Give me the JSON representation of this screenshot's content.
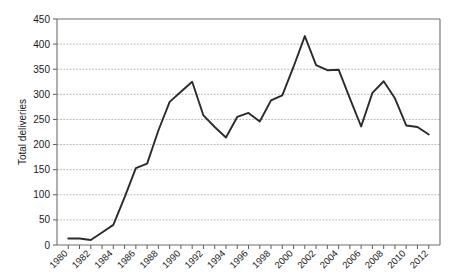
{
  "chart_data": {
    "type": "line",
    "title": "",
    "subtitle": "",
    "xlabel": "",
    "ylabel": "Total deliveries",
    "xlim": [
      1979,
      2013
    ],
    "ylim": [
      0,
      450
    ],
    "ytick_step": 50,
    "xtick_step": 2,
    "grid": true,
    "grid_axis": "y",
    "legend": false,
    "legend_position": "none",
    "yticks": [
      0,
      50,
      100,
      150,
      200,
      250,
      300,
      350,
      400,
      450
    ],
    "ytick_labels": [
      "0",
      "50",
      "100",
      "150",
      "200",
      "250",
      "300",
      "350",
      "400",
      "450"
    ],
    "xticks": [
      1980,
      1982,
      1984,
      1986,
      1988,
      1990,
      1992,
      1994,
      1996,
      1998,
      2000,
      2002,
      2004,
      2006,
      2008,
      2010,
      2012
    ],
    "xtick_labels": [
      "1980",
      "1982",
      "1984",
      "1986",
      "1988",
      "1990",
      "1992",
      "1994",
      "1996",
      "1998",
      "2000",
      "2002",
      "2004",
      "2006",
      "2008",
      "2010",
      "2012"
    ],
    "x": [
      1980,
      1981,
      1982,
      1983,
      1984,
      1985,
      1986,
      1987,
      1988,
      1989,
      1990,
      1991,
      1992,
      1993,
      1994,
      1995,
      1996,
      1997,
      1998,
      1999,
      2000,
      2001,
      2002,
      2003,
      2004,
      2005,
      2006,
      2007,
      2008,
      2009,
      2010,
      2011,
      2012
    ],
    "values": [
      13,
      13,
      10,
      25,
      40,
      95,
      153,
      162,
      228,
      285,
      305,
      325,
      258,
      235,
      214,
      255,
      263,
      246,
      288,
      298,
      355,
      416,
      358,
      348,
      349,
      292,
      236,
      303,
      326,
      292,
      238,
      235,
      220
    ],
    "series": [
      {
        "name": "Total deliveries",
        "color": "#2b2b2b",
        "values": [
          13,
          13,
          10,
          25,
          40,
          95,
          153,
          162,
          228,
          285,
          305,
          325,
          258,
          235,
          214,
          255,
          263,
          246,
          288,
          298,
          355,
          416,
          358,
          348,
          349,
          292,
          236,
          303,
          326,
          292,
          238,
          235,
          220
        ]
      }
    ]
  },
  "colors": {
    "line": "#2b2b2b",
    "grid": "#9a9a9a",
    "axis": "#6e6e6e",
    "text": "#1a1a1a",
    "background": "#ffffff"
  }
}
